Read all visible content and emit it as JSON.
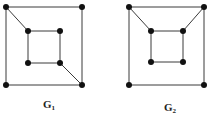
{
  "diagram": {
    "type": "graph-pair",
    "colors": {
      "edge": "#3a3a3a",
      "node": "#111111",
      "label": "#222222",
      "background": "#ffffff"
    },
    "graphs": [
      {
        "id": "G1",
        "label_base": "G",
        "label_sub": "1",
        "label_pos": [
          43,
          99
        ],
        "nodes": {
          "o_tl": [
            6,
            7
          ],
          "o_tr": [
            82,
            7
          ],
          "o_bl": [
            6,
            85
          ],
          "o_br": [
            82,
            85
          ],
          "i_tl": [
            28,
            31
          ],
          "i_tr": [
            60,
            31
          ],
          "i_bl": [
            28,
            63
          ],
          "i_br": [
            60,
            63
          ]
        },
        "edges": [
          [
            "o_tl",
            "o_tr"
          ],
          [
            "o_tr",
            "o_br"
          ],
          [
            "o_br",
            "o_bl"
          ],
          [
            "o_bl",
            "o_tl"
          ],
          [
            "i_tl",
            "i_tr"
          ],
          [
            "i_tr",
            "i_br"
          ],
          [
            "i_br",
            "i_bl"
          ],
          [
            "i_bl",
            "i_tl"
          ],
          [
            "o_tl",
            "i_tl"
          ],
          [
            "i_br",
            "o_br"
          ]
        ]
      },
      {
        "id": "G2",
        "label_base": "G",
        "label_sub": "2",
        "label_pos": [
          164,
          102
        ],
        "nodes": {
          "o_tl": [
            129,
            7
          ],
          "o_tr": [
            204,
            7
          ],
          "o_bl": [
            129,
            85
          ],
          "o_br": [
            204,
            85
          ],
          "i_tl": [
            151,
            31
          ],
          "i_tr": [
            183,
            31
          ],
          "i_bl": [
            151,
            62
          ],
          "i_br": [
            183,
            62
          ]
        },
        "edges": [
          [
            "o_tl",
            "o_tr"
          ],
          [
            "o_tr",
            "o_br"
          ],
          [
            "o_br",
            "o_bl"
          ],
          [
            "o_bl",
            "o_tl"
          ],
          [
            "i_tl",
            "i_tr"
          ],
          [
            "i_tr",
            "i_br"
          ],
          [
            "i_br",
            "i_bl"
          ],
          [
            "i_bl",
            "i_tl"
          ],
          [
            "o_tl",
            "i_tl"
          ],
          [
            "o_tr",
            "i_tr"
          ]
        ]
      }
    ]
  }
}
